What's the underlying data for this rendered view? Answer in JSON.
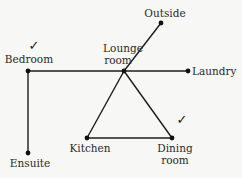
{
  "diagram": {
    "type": "network-graph",
    "nodes": [
      {
        "id": "bedroom",
        "label": "Bedroom",
        "x": 28,
        "y": 71,
        "checked": true
      },
      {
        "id": "lounge",
        "label_line1": "Lounge",
        "label_line2": "room",
        "x": 124,
        "y": 71,
        "checked": false
      },
      {
        "id": "laundry",
        "label": "Laundry",
        "x": 188,
        "y": 71,
        "checked": false
      },
      {
        "id": "outside",
        "label": "Outside",
        "x": 161,
        "y": 23,
        "checked": false
      },
      {
        "id": "ensuite",
        "label": "Ensuite",
        "x": 28,
        "y": 153,
        "checked": false
      },
      {
        "id": "kitchen",
        "label": "Kitchen",
        "x": 87,
        "y": 138,
        "checked": false
      },
      {
        "id": "dining",
        "label_line1": "Dining",
        "label_line2": "room",
        "x": 172,
        "y": 138,
        "checked": true
      }
    ],
    "edges": [
      [
        "bedroom",
        "lounge"
      ],
      [
        "lounge",
        "laundry"
      ],
      [
        "lounge",
        "outside"
      ],
      [
        "bedroom",
        "ensuite"
      ],
      [
        "lounge",
        "kitchen"
      ],
      [
        "lounge",
        "dining"
      ],
      [
        "kitchen",
        "dining"
      ]
    ],
    "check_symbol": "✓",
    "colors": {
      "line": "#1c1c1c",
      "node": "#111111",
      "text": "#2a2a2a",
      "background": "#f7f7f5"
    }
  }
}
